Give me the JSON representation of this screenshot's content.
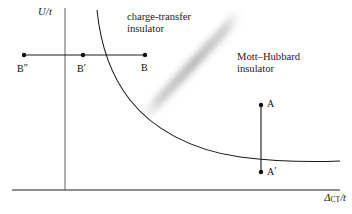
{
  "figure": {
    "background_color": "#ffffff",
    "line_color": "#1a1a1a",
    "band_color": "#b9b9b9"
  },
  "axes": {
    "y_label": "U/t",
    "x_label_delta": "Δ",
    "x_label_sub": "CT",
    "x_label_rest": "/t",
    "x_label_full": "ΔCT/t",
    "x_axis": {
      "x_start": 12,
      "x_end": 340,
      "y": 190
    },
    "y_axis": {
      "x": 65,
      "y_start": 8,
      "y_end": 190
    }
  },
  "regions": [
    {
      "name": "charge-transfer-insulator",
      "line1": "charge-transfer",
      "line2": "insulator"
    },
    {
      "name": "mott-hubbard-insulator",
      "line1": "Mott–Hubbard",
      "line2": "insulator"
    }
  ],
  "curve": {
    "type": "hyperbola-boundary",
    "description": "phase boundary separating charge-transfer insulator from Mott-Hubbard insulator",
    "path": "M 97,10 C 100,40 108,72 130,100 C 152,128 190,150 240,157 C 280,162 315,162 340,161"
  },
  "crossover_band": {
    "name": "crossover-band",
    "from": {
      "x": 148,
      "y": 112
    },
    "to": {
      "x": 236,
      "y": 18
    }
  },
  "segments": [
    {
      "name": "segment-B",
      "orientation": "horizontal",
      "y": 55,
      "x_start": 24,
      "x_end": 145,
      "points": [
        {
          "label": "B″",
          "label_base": "B",
          "prime": "″",
          "x": 24,
          "y": 55
        },
        {
          "label": "B′",
          "label_base": "B",
          "prime": "′",
          "x": 83,
          "y": 55
        },
        {
          "label": "B",
          "label_base": "B",
          "prime": "",
          "x": 145,
          "y": 55
        }
      ]
    },
    {
      "name": "segment-A",
      "orientation": "vertical",
      "x": 261,
      "y_start": 105,
      "y_end": 172,
      "points": [
        {
          "label": "A",
          "label_base": "A",
          "prime": "",
          "x": 261,
          "y": 105
        },
        {
          "label": "A′",
          "label_base": "A",
          "prime": "′",
          "x": 261,
          "y": 172
        }
      ]
    }
  ],
  "point_labels": {
    "B_double_prime_base": "B",
    "B_double_prime_mark": "″",
    "B_prime_base": "B",
    "B_prime_mark": "′",
    "B_base": "B",
    "A_base": "A",
    "A_prime_base": "A",
    "A_prime_mark": "′"
  }
}
